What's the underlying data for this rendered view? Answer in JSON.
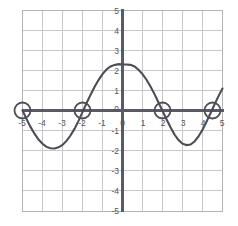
{
  "chart_data": {
    "type": "line",
    "title": "",
    "xlabel": "",
    "ylabel": "",
    "xlim": [
      -5,
      5
    ],
    "ylim": [
      -5,
      5
    ],
    "grid": true,
    "legend": "none",
    "x_ticks": [
      "-5",
      "-4",
      "-3",
      "-2",
      "-1",
      "0",
      "1",
      "2",
      "3",
      "4",
      "5"
    ],
    "y_ticks": [
      "5",
      "4",
      "3",
      "2",
      "1",
      "0",
      "-1",
      "-2",
      "-3",
      "-4",
      "-5"
    ],
    "x_tick_values": [
      -5,
      -4,
      -3,
      -2,
      -1,
      0,
      1,
      2,
      3,
      4,
      5
    ],
    "y_tick_values": [
      5,
      4,
      3,
      2,
      1,
      0,
      -1,
      -2,
      -3,
      -4,
      -5
    ],
    "origin_label": "0",
    "series": [
      {
        "name": "curve",
        "color": "#4c4c55",
        "description": "sinusoidal wave, amplitude about 2.3, one full period across the visible domain",
        "points": [
          [
            -5.0,
            0.0
          ],
          [
            -4.8,
            -0.42
          ],
          [
            -4.6,
            -0.82
          ],
          [
            -4.4,
            -1.16
          ],
          [
            -4.2,
            -1.45
          ],
          [
            -4.0,
            -1.66
          ],
          [
            -3.8,
            -1.82
          ],
          [
            -3.6,
            -1.89
          ],
          [
            -3.4,
            -1.9
          ],
          [
            -3.2,
            -1.84
          ],
          [
            -3.0,
            -1.72
          ],
          [
            -2.8,
            -1.52
          ],
          [
            -2.6,
            -1.25
          ],
          [
            -2.4,
            -0.92
          ],
          [
            -2.2,
            -0.52
          ],
          [
            -2.0,
            -0.08
          ],
          [
            -1.8,
            0.36
          ],
          [
            -1.6,
            0.78
          ],
          [
            -1.4,
            1.17
          ],
          [
            -1.2,
            1.52
          ],
          [
            -1.0,
            1.82
          ],
          [
            -0.8,
            2.05
          ],
          [
            -0.6,
            2.2
          ],
          [
            -0.4,
            2.28
          ],
          [
            -0.2,
            2.32
          ],
          [
            0.0,
            2.3
          ],
          [
            0.2,
            2.3
          ],
          [
            0.4,
            2.28
          ],
          [
            0.6,
            2.2
          ],
          [
            0.8,
            2.04
          ],
          [
            1.0,
            1.82
          ],
          [
            1.2,
            1.54
          ],
          [
            1.4,
            1.2
          ],
          [
            1.6,
            0.82
          ],
          [
            1.8,
            0.4
          ],
          [
            2.0,
            -0.02
          ],
          [
            2.2,
            -0.44
          ],
          [
            2.4,
            -0.84
          ],
          [
            2.6,
            -1.2
          ],
          [
            2.8,
            -1.48
          ],
          [
            3.0,
            -1.66
          ],
          [
            3.2,
            -1.73
          ],
          [
            3.4,
            -1.7
          ],
          [
            3.6,
            -1.55
          ],
          [
            3.8,
            -1.3
          ],
          [
            4.0,
            -0.96
          ],
          [
            4.2,
            -0.56
          ],
          [
            4.4,
            -0.14
          ],
          [
            4.6,
            0.3
          ],
          [
            4.8,
            0.72
          ],
          [
            5.0,
            1.1
          ]
        ]
      }
    ],
    "marked_points": [
      {
        "label": "x-intercept",
        "x": -5.0,
        "y": 0.0
      },
      {
        "label": "x-intercept",
        "x": -2.0,
        "y": 0.0
      },
      {
        "label": "x-intercept",
        "x": 2.0,
        "y": 0.0
      },
      {
        "label": "x-intercept",
        "x": 4.5,
        "y": 0.0
      }
    ],
    "marker_style": {
      "shape": "circle",
      "radius_px": 8,
      "fill": "none",
      "stroke": "#4c4c55"
    },
    "colors": {
      "curve": "#4c4c55",
      "axis": "#5a5a66",
      "grid": "#c8c8c8",
      "border": "#b4b4b4",
      "tick_text": "#55555f",
      "background": "#ffffff"
    }
  }
}
